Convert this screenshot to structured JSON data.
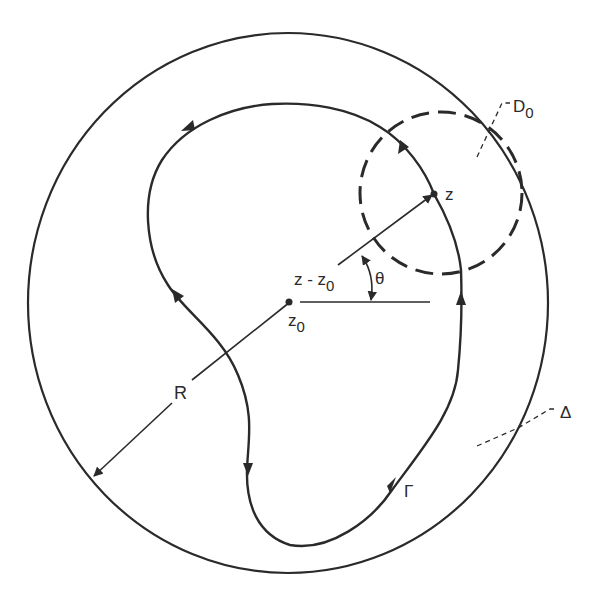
{
  "diagram": {
    "title": "",
    "colors": {
      "ink": "#2a2a2a",
      "background": "#ffffff"
    },
    "labels": {
      "outer_disk": "Δ",
      "small_disk": "D",
      "small_disk_sub": "0",
      "point_z": "z",
      "point_z0": "z",
      "point_z0_sub": "0",
      "vector": "z - z",
      "vector_sub": "0",
      "angle": "θ",
      "radius": "R",
      "contour": "Γ"
    },
    "elements": [
      {
        "id": "outer-circle",
        "kind": "circle",
        "style": "solid",
        "label": "Δ"
      },
      {
        "id": "dashed-circle",
        "kind": "circle",
        "style": "dashed",
        "label": "D0",
        "centered_at": "z"
      },
      {
        "id": "contour",
        "kind": "closed-curve",
        "style": "solid",
        "label": "Γ",
        "orientation": "counterclockwise",
        "arrow_count": 6
      },
      {
        "id": "radius-line",
        "kind": "arrow",
        "from": "z0",
        "to": "outer-circle",
        "label": "R"
      },
      {
        "id": "vector",
        "kind": "arrow",
        "from": "z0",
        "to": "z",
        "label": "z - z0"
      },
      {
        "id": "reference-axis",
        "kind": "line",
        "from": "z0",
        "direction": "horizontal"
      },
      {
        "id": "angle-arc",
        "kind": "arc",
        "label": "θ",
        "double_headed": true
      }
    ]
  }
}
